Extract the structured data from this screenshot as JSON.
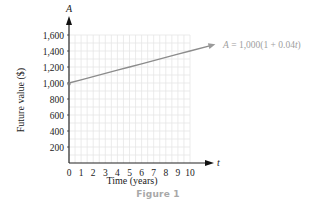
{
  "chart_data": {
    "type": "line",
    "title": "",
    "xlabel": "Time (years)",
    "ylabel": "Future value ($)",
    "x_axis_var": "t",
    "y_axis_var": "A",
    "x": [
      0,
      1,
      2,
      3,
      4,
      5,
      6,
      7,
      8,
      9,
      10
    ],
    "series": [
      {
        "name": "A = 1,000(1 + 0.04t)",
        "values": [
          1000,
          1040,
          1080,
          1120,
          1160,
          1200,
          1240,
          1280,
          1320,
          1360,
          1400
        ]
      }
    ],
    "xticks": [
      "0",
      "1",
      "2",
      "3",
      "4",
      "5",
      "6",
      "7",
      "8",
      "9",
      "10"
    ],
    "yticks": [
      "200",
      "400",
      "600",
      "800",
      "1,000",
      "1,200",
      "1,400",
      "1,600"
    ],
    "xlim": [
      0,
      10
    ],
    "ylim": [
      0,
      1600
    ],
    "grid": true,
    "annotation": "A = 1,000(1 + 0.04t)",
    "line_color": "#8c8c8c",
    "grid_color": "#e6e6e6"
  },
  "labels": {
    "y_axis_var": "A",
    "x_axis_var": "t",
    "xlabel": "Time (years)",
    "ylabel": "Future value ($)",
    "equation_lhs": "A",
    "equation_rhs": " = 1,000(1 + 0.04",
    "equation_var": "t",
    "equation_close": ")",
    "caption": "Figure 1"
  }
}
